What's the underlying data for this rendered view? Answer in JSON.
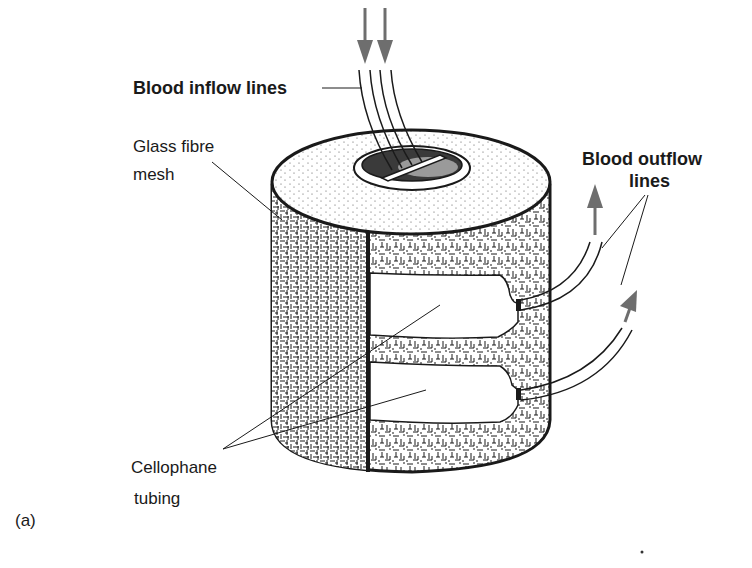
{
  "figure": {
    "panel_label": "(a)",
    "colors": {
      "ink": "#1a1a1a",
      "arrow": "#6e6e6e",
      "background": "#ffffff"
    }
  },
  "labels": {
    "blood_inflow": "Blood inflow lines",
    "glass_fibre_line1": "Glass fibre",
    "glass_fibre_line2": "mesh",
    "blood_outflow_line1": "Blood outflow",
    "blood_outflow_line2": "lines",
    "cellophane_line1": "Cellophane",
    "cellophane_line2": "tubing"
  },
  "arrows": [
    {
      "name": "inflow-arrow-1",
      "direction": "down"
    },
    {
      "name": "inflow-arrow-2",
      "direction": "down"
    },
    {
      "name": "outflow-arrow-1",
      "direction": "up"
    },
    {
      "name": "outflow-arrow-2",
      "direction": "up-right"
    }
  ]
}
